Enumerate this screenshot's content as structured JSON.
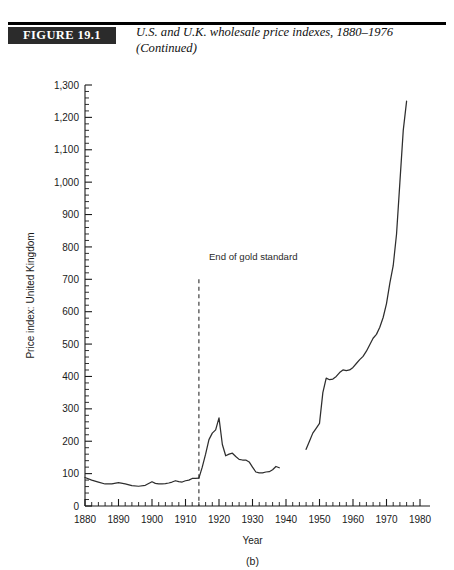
{
  "figure": {
    "tag": "FIGURE 19.1",
    "caption_line1": "U.S. and U.K. wholesale price indexes, 1880–1976",
    "caption_line2": "(Continued)"
  },
  "chart_data": {
    "type": "line",
    "title": "U.S. and U.K. wholesale price indexes, 1880–1976",
    "panel_label": "(b)",
    "xlabel": "Year",
    "ylabel": "Price index: United Kingdom",
    "xlim": [
      1880,
      1980
    ],
    "ylim": [
      0,
      1300
    ],
    "grid": false,
    "legend": "none",
    "x_ticks": [
      1880,
      1890,
      1900,
      1910,
      1920,
      1930,
      1940,
      1950,
      1960,
      1970,
      1980
    ],
    "x_tick_labels": [
      "1880",
      "1890",
      "1900",
      "1910",
      "1920",
      "1930",
      "1940",
      "1950",
      "1960",
      "1970",
      "1980"
    ],
    "x_minor_step": 2,
    "y_ticks": [
      0,
      100,
      200,
      300,
      400,
      500,
      600,
      700,
      800,
      900,
      1000,
      1100,
      1200,
      1300
    ],
    "y_tick_labels": [
      "0",
      "100",
      "200",
      "300",
      "400",
      "500",
      "600",
      "700",
      "800",
      "900",
      "1,000",
      "1,100",
      "1,200",
      "1,300"
    ],
    "y_minor_step": 20,
    "annotations": [
      {
        "text": "End of gold standard",
        "x": 1914,
        "kind": "vertical-dashed-line-with-label",
        "label_x": 1917,
        "label_y": 760,
        "line_y_top": 700,
        "line_y_bottom": 0
      }
    ],
    "series": [
      {
        "name": "Price index: United Kingdom",
        "color": "#2e2e2e",
        "segments": [
          {
            "name": "1880-1914",
            "x": [
              1880,
              1882,
              1884,
              1886,
              1888,
              1890,
              1892,
              1894,
              1896,
              1898,
              1900,
              1901,
              1902,
              1903,
              1904,
              1905,
              1906,
              1907,
              1908,
              1909,
              1910,
              1911,
              1912,
              1913,
              1914
            ],
            "y": [
              88,
              80,
              74,
              68,
              68,
              72,
              68,
              63,
              61,
              64,
              75,
              70,
              68,
              68,
              69,
              71,
              74,
              78,
              75,
              74,
              78,
              80,
              85,
              85,
              86
            ]
          },
          {
            "name": "1914-1938",
            "x": [
              1914,
              1915,
              1916,
              1917,
              1918,
              1919,
              1920,
              1921,
              1922,
              1923,
              1924,
              1925,
              1926,
              1927,
              1928,
              1929,
              1930,
              1931,
              1932,
              1933,
              1934,
              1935,
              1936,
              1937,
              1938
            ],
            "y": [
              86,
              120,
              160,
              205,
              225,
              235,
              272,
              190,
              155,
              160,
              163,
              153,
              144,
              142,
              142,
              136,
              120,
              105,
              102,
              102,
              105,
              106,
              112,
              122,
              118
            ]
          },
          {
            "name": "1946-1976",
            "x": [
              1946,
              1947,
              1948,
              1949,
              1950,
              1951,
              1952,
              1953,
              1954,
              1955,
              1956,
              1957,
              1958,
              1959,
              1960,
              1961,
              1962,
              1963,
              1964,
              1965,
              1966,
              1967,
              1968,
              1969,
              1970,
              1971,
              1972,
              1973,
              1974,
              1975,
              1976
            ],
            "y": [
              175,
              200,
              225,
              240,
              255,
              350,
              395,
              390,
              392,
              400,
              412,
              420,
              418,
              420,
              428,
              440,
              452,
              462,
              478,
              498,
              518,
              530,
              552,
              582,
              625,
              688,
              742,
              840,
              1000,
              1160,
              1250
            ]
          }
        ]
      }
    ]
  }
}
